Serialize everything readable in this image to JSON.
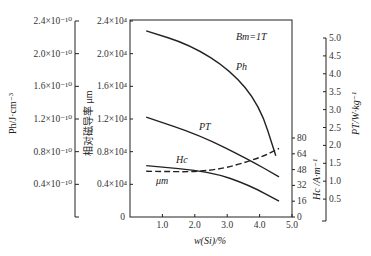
{
  "chart_data": {
    "type": "line",
    "title": "",
    "annotation": "Bm=1T",
    "xlabel": "w(Si)/%",
    "xlim": [
      0,
      5.0
    ],
    "xticks": [
      "1.0",
      "2.0",
      "3.0",
      "4.0",
      "5.0"
    ],
    "axes": {
      "ph_axis": {
        "label": "Ph/J·cm⁻³",
        "ticks": [
          "2.4×10⁻¹⁰",
          "2.0×10⁻¹⁰",
          "1.6×10⁻¹⁰",
          "1.2×10⁻¹⁰",
          "0.8×10⁻¹⁰",
          "0.4×10⁻¹⁰"
        ],
        "range": [
          0,
          2.4e-10
        ]
      },
      "mu_axis": {
        "label": "相对磁导率 μm",
        "ticks": [
          "2.4×10⁴",
          "2.0×10⁴",
          "1.6×10⁴",
          "1.2×10⁴",
          "0.8×10⁴",
          "0.4×10⁴",
          "0"
        ],
        "range": [
          0,
          24000
        ]
      },
      "hc_axis": {
        "label": "Hc /A·m⁻¹",
        "ticks": [
          "80",
          "64",
          "48",
          "32",
          "16",
          "0"
        ],
        "range": [
          0,
          80
        ]
      },
      "pt_axis": {
        "label": "PT/W·kg⁻¹",
        "ticks": [
          "5.0",
          "4.5",
          "4.0",
          "3.5",
          "3.0",
          "2.5",
          "2.0",
          "1.5",
          "1.0",
          "0.5"
        ],
        "range": [
          0,
          5.0
        ]
      }
    },
    "series": [
      {
        "name": "Ph",
        "axis": "ph_axis",
        "style": "solid",
        "x": [
          0.5,
          1.85,
          3.1,
          4.0,
          4.5
        ],
        "values": [
          2.28e-10,
          2.11e-10,
          1.8e-10,
          1.37e-10,
          7.5e-11
        ]
      },
      {
        "name": "PT",
        "axis": "pt_axis",
        "style": "solid",
        "x": [
          0.5,
          2.15,
          3.7,
          4.6
        ],
        "values": [
          2.79,
          2.29,
          1.59,
          1.12
        ]
      },
      {
        "name": "Hc",
        "axis": "hc_axis",
        "style": "solid",
        "x": [
          0.5,
          2.5,
          3.7,
          4.6
        ],
        "values": [
          52,
          46,
          32,
          16
        ]
      },
      {
        "name": "μm",
        "axis": "mu_axis",
        "style": "dashed",
        "x": [
          0.5,
          2.5,
          4.0,
          4.6
        ],
        "values": [
          5600,
          5500,
          7200,
          8400
        ]
      }
    ],
    "grid": false,
    "legend": "inline labels"
  },
  "labels": {
    "annotation_B": "B",
    "annotation_sub": "m",
    "annotation_rest": "=1T",
    "xlabel": "w(Si)/%",
    "ph_label": "Ph/J·cm⁻³",
    "mu_label": "相对磁导率 μm",
    "hc_label": "Hc /A·m⁻¹",
    "pt_label": "PT/W·kg⁻¹",
    "curve_ph": "Ph",
    "curve_pt": "PT",
    "curve_hc": "Hc",
    "curve_mu": "μm"
  }
}
